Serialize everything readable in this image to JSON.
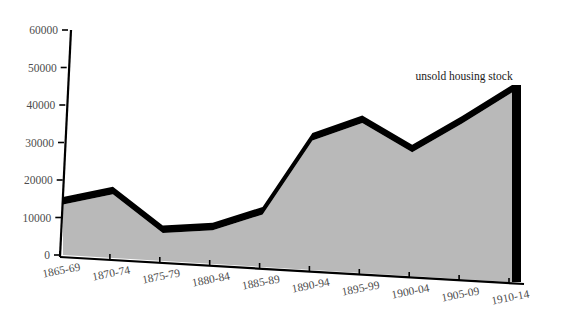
{
  "chart_data": {
    "type": "area",
    "title": "",
    "subtitle": "",
    "xlabel": "",
    "ylabel": "",
    "categories": [
      "1865-69",
      "1870-74",
      "1875-79",
      "1880-84",
      "1885-89",
      "1890-94",
      "1895-99",
      "1900-04",
      "1905-09",
      "1910-14"
    ],
    "series": [
      {
        "name": "unsold housing stock",
        "values": [
          13500,
          17000,
          7500,
          9000,
          14000,
          34500,
          40000,
          33000,
          41500,
          50500
        ]
      }
    ],
    "ylim": [
      0,
      60000
    ],
    "ytick_labels": [
      "0",
      "10000",
      "20000",
      "30000",
      "40000",
      "50000",
      "60000"
    ],
    "ytick_values": [
      0,
      10000,
      20000,
      30000,
      40000,
      50000,
      60000
    ],
    "grid": false,
    "legend_position": "none",
    "annotations": [
      {
        "text": "unsold housing stock",
        "x_category": "1905-09",
        "y_value": 53000
      }
    ],
    "style": {
      "area_fill": "#b9b9b9",
      "line_color": "#000000",
      "axis_color": "#000000",
      "tick_label_color": "#4d4d4d",
      "background": "#ffffff",
      "three_d": true
    }
  },
  "axes": {
    "y_axis_name": "value-axis",
    "x_axis_name": "period-axis"
  }
}
